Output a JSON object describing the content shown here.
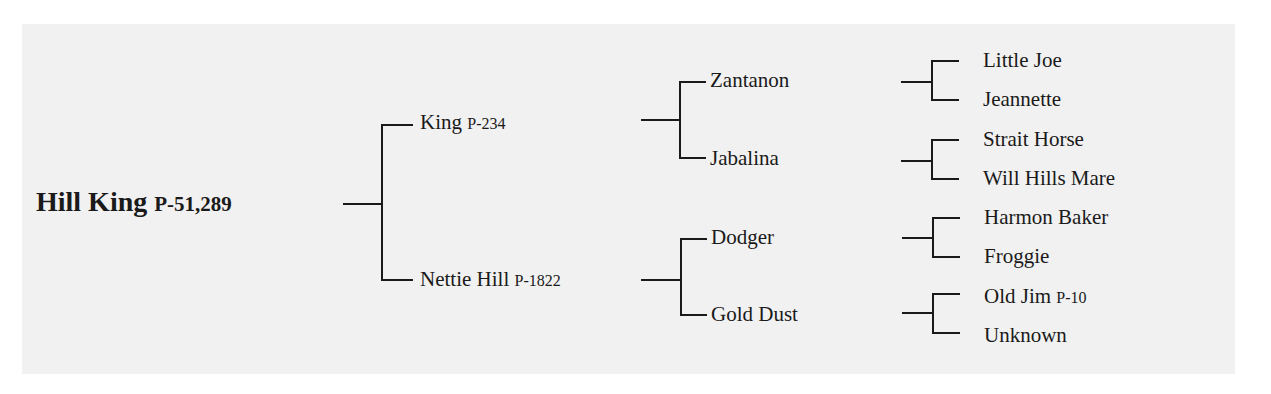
{
  "pedigree": {
    "subject": {
      "name": "Hill King",
      "reg": "P-51,289"
    },
    "sire": {
      "name": "King",
      "reg": "P-234"
    },
    "dam": {
      "name": "Nettie Hill",
      "reg": "P-1822"
    },
    "sire_sire": {
      "name": "Zantanon"
    },
    "sire_dam": {
      "name": "Jabalina"
    },
    "dam_sire": {
      "name": "Dodger"
    },
    "dam_dam": {
      "name": "Gold Dust"
    },
    "ggen": [
      {
        "name": "Little Joe"
      },
      {
        "name": "Jeannette"
      },
      {
        "name": "Strait Horse"
      },
      {
        "name": "Will Hills Mare"
      },
      {
        "name": "Harmon Baker"
      },
      {
        "name": "Froggie"
      },
      {
        "name": "Old Jim",
        "reg": "P-10"
      },
      {
        "name": "Unknown"
      }
    ]
  },
  "colors": {
    "background": "#ffffff",
    "panel": "#f1f1f1",
    "line": "#1a1a1a",
    "text": "#1a1a1a"
  }
}
